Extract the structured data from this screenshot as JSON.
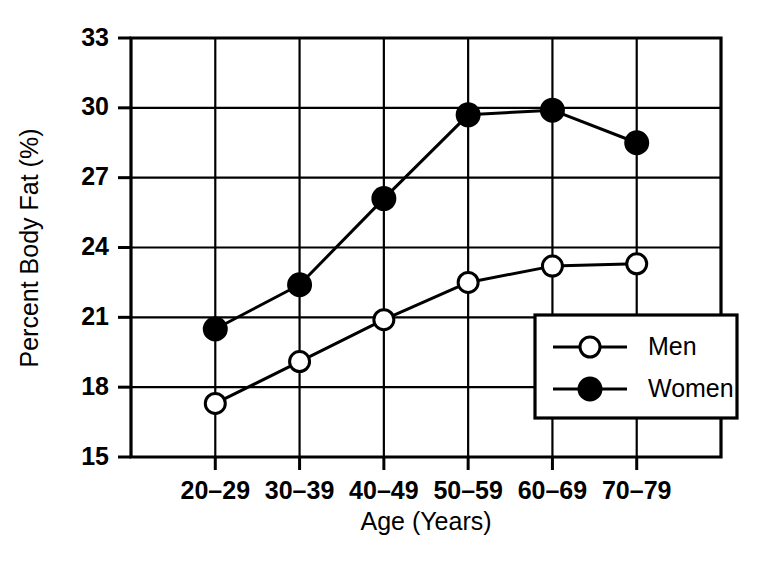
{
  "chart_data": {
    "type": "line",
    "title": "",
    "subtitle": "",
    "xlabel": "Age (Years)",
    "ylabel": "Percent Body Fat (%)",
    "categories": [
      "20–29",
      "30–39",
      "40–49",
      "50–59",
      "60–69",
      "70–79"
    ],
    "ylim": [
      15,
      33
    ],
    "yticks": [
      15,
      18,
      21,
      24,
      27,
      30,
      33
    ],
    "ytick_labels": [
      "15",
      "18",
      "21",
      "24",
      "27",
      "30",
      "33"
    ],
    "grid": "both",
    "legend_position": "lower-right-inside",
    "series": [
      {
        "name": "Men",
        "marker": "open-circle",
        "color": "#000000",
        "values": [
          17.3,
          19.1,
          20.9,
          22.5,
          23.2,
          23.3
        ]
      },
      {
        "name": "Women",
        "marker": "filled-circle",
        "color": "#000000",
        "values": [
          20.5,
          22.4,
          26.1,
          29.7,
          29.9,
          28.5
        ]
      }
    ],
    "annotations": []
  },
  "legend": {
    "entries": [
      {
        "label": "Men",
        "marker": "open-circle"
      },
      {
        "label": "Women",
        "marker": "filled-circle"
      }
    ]
  },
  "colors": {
    "background": "#ffffff",
    "foreground": "#000000",
    "grid": "#000000"
  }
}
